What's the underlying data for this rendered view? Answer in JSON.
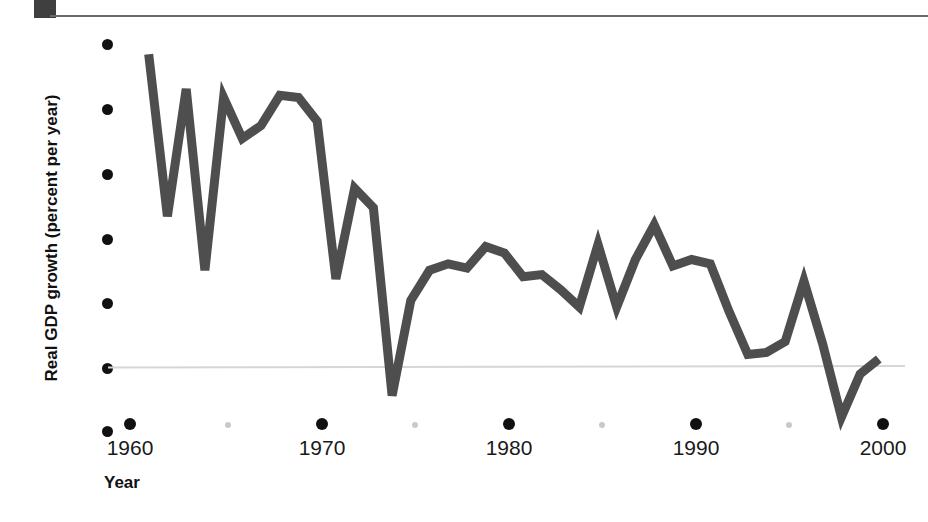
{
  "figure": {
    "top_rule": "horizontal-rule",
    "corner_block_color": "#3f3f3f"
  },
  "axes": {
    "y_title": "Real GDP growth (percent per year)",
    "x_title": "Year",
    "y_ticks": [
      "15",
      "12",
      "9",
      "6",
      "3",
      "0",
      "-3"
    ],
    "x_ticks_major": [
      "1960",
      "1970",
      "1980",
      "1990",
      "2000"
    ],
    "x_ticks_minor": [
      "1965",
      "1975",
      "1985",
      "1995"
    ],
    "zero_line_color": "#d6d6d6",
    "line_color": "#4e4e4e"
  },
  "chart_data": {
    "type": "line",
    "title": "",
    "subtitle": "",
    "xlabel": "Year",
    "ylabel": "Real GDP growth (percent per year)",
    "xlim": [
      1959,
      2001
    ],
    "ylim": [
      -3,
      15
    ],
    "yticks": [
      15,
      12,
      9,
      6,
      3,
      0,
      -3
    ],
    "xticks": [
      1960,
      1970,
      1980,
      1990,
      2000
    ],
    "xticks_minor": [
      1965,
      1975,
      1985,
      1995
    ],
    "grid": false,
    "legend": null,
    "series": [
      {
        "name": "Real GDP growth",
        "color": "#4e4e4e",
        "x": [
          1961,
          1962,
          1963,
          1964,
          1965,
          1966,
          1967,
          1968,
          1969,
          1970,
          1971,
          1972,
          1973,
          1974,
          1975,
          1976,
          1977,
          1978,
          1979,
          1980,
          1981,
          1982,
          1983,
          1984,
          1985,
          1986,
          1987,
          1988,
          1989,
          1990,
          1991,
          1992,
          1993,
          1994,
          1995,
          1996,
          1997,
          1998,
          1999,
          2000
        ],
        "values": [
          14.5,
          7.0,
          12.9,
          4.5,
          12.5,
          10.6,
          11.2,
          12.6,
          12.5,
          11.4,
          4.1,
          8.3,
          7.4,
          -1.3,
          3.1,
          4.5,
          4.8,
          4.6,
          5.6,
          5.3,
          4.2,
          4.3,
          3.6,
          2.8,
          5.7,
          2.8,
          5.0,
          6.6,
          4.7,
          5.0,
          4.8,
          2.6,
          0.6,
          0.7,
          1.2,
          4.0,
          1.1,
          -2.3,
          -0.3,
          0.4
        ]
      }
    ]
  }
}
